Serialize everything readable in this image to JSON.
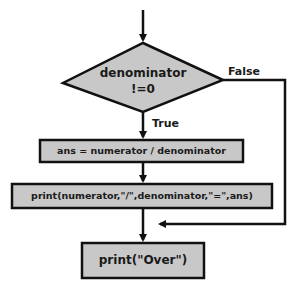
{
  "flowchart": {
    "decision": {
      "line1": "denominator",
      "line2": "!=0"
    },
    "branches": {
      "true_label": "True",
      "false_label": "False"
    },
    "steps": [
      {
        "text": "ans = numerator / denominator"
      },
      {
        "text": "print(numerator,\"/\",denominator,\"=\",ans)"
      },
      {
        "text": "print(\"Over\")"
      }
    ],
    "colors": {
      "fill": "#c8c8c8",
      "stroke": "#111111",
      "background": "#ffffff"
    }
  }
}
